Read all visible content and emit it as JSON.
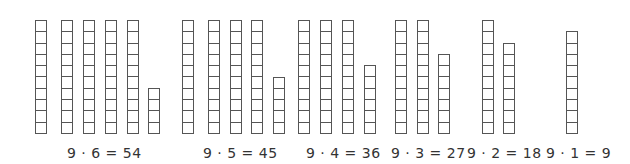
{
  "diagram": {
    "cell_color": "#555555",
    "bottom_y": 134,
    "cell_height": 12.3,
    "groups": [
      {
        "label": "9 · 6 = 54",
        "label_x": 67,
        "columns": [
          {
            "x": 35,
            "cells": 10
          },
          {
            "x": 61,
            "cells": 10
          },
          {
            "x": 83,
            "cells": 10
          },
          {
            "x": 105,
            "cells": 10
          },
          {
            "x": 127,
            "cells": 10
          },
          {
            "x": 148,
            "cells": 4
          }
        ]
      },
      {
        "label": "9 · 5 = 45",
        "label_x": 203,
        "columns": [
          {
            "x": 182,
            "cells": 10
          },
          {
            "x": 208,
            "cells": 10
          },
          {
            "x": 230,
            "cells": 10
          },
          {
            "x": 251,
            "cells": 10
          },
          {
            "x": 273,
            "cells": 5
          }
        ]
      },
      {
        "label": "9 · 4 = 36",
        "label_x": 306,
        "columns": [
          {
            "x": 298,
            "cells": 10
          },
          {
            "x": 320,
            "cells": 10
          },
          {
            "x": 342,
            "cells": 10
          },
          {
            "x": 364,
            "cells": 6
          }
        ]
      },
      {
        "label": "9 · 3 = 27",
        "label_x": 391,
        "columns": [
          {
            "x": 395,
            "cells": 10
          },
          {
            "x": 417,
            "cells": 10
          },
          {
            "x": 438,
            "cells": 7
          }
        ]
      },
      {
        "label": "9 · 2 = 18",
        "label_x": 467,
        "columns": [
          {
            "x": 482,
            "cells": 10
          },
          {
            "x": 503,
            "cells": 8
          }
        ]
      },
      {
        "label": "9 · 1 = 9",
        "label_x": 546,
        "columns": [
          {
            "x": 566,
            "cells": 9
          }
        ]
      }
    ]
  }
}
